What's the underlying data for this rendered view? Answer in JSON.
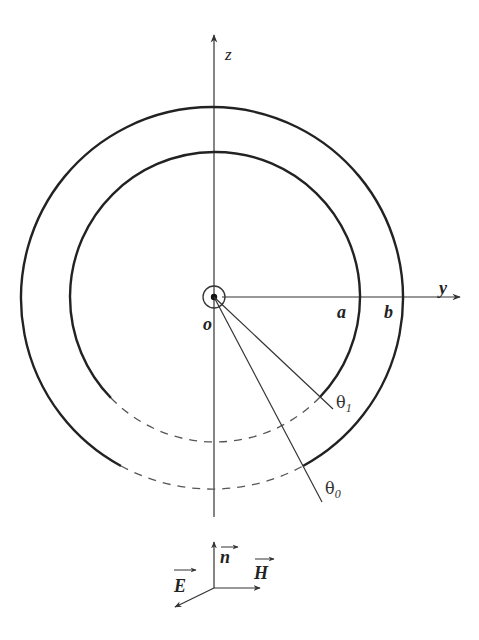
{
  "figure": {
    "type": "coaxial-spherical-shell-cross-section",
    "axes": {
      "z_label": "z",
      "y_label": "y",
      "origin_label": "o"
    },
    "radii": {
      "inner_label": "a",
      "outer_label": "b"
    },
    "angles": {
      "theta1_symbol": "θ",
      "theta1_subscript": "1",
      "theta0_symbol": "θ",
      "theta0_subscript": "0"
    },
    "legend": {
      "n_label": "n",
      "E_label": "E",
      "H_label": "H"
    },
    "colors": {
      "stroke": "#222222",
      "dashed": "#555555"
    }
  }
}
